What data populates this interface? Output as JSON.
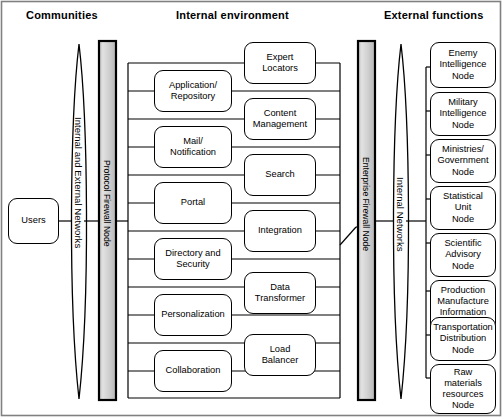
{
  "diagram": {
    "headers": [
      {
        "label": "Communities"
      },
      {
        "label": "Internal environment"
      },
      {
        "label": "External functions"
      }
    ],
    "users_node": {
      "label": "Users"
    },
    "networks_lens_left": {
      "label": "Internal and External Networks"
    },
    "networks_lens_right": {
      "label": "Internal Networks"
    },
    "firewalls": [
      {
        "label": "Protocol Firewall Node"
      },
      {
        "label": "Enterprise Firewall Node"
      }
    ],
    "internal_left_column": [
      {
        "label": "Application/\nRepository"
      },
      {
        "label": "Mail/\nNotification"
      },
      {
        "label": "Portal"
      },
      {
        "label": "Directory and\nSecurity"
      },
      {
        "label": "Personalization"
      },
      {
        "label": "Collaboration"
      }
    ],
    "internal_right_column": [
      {
        "label": "Expert\nLocators"
      },
      {
        "label": "Content\nManagement"
      },
      {
        "label": "Search"
      },
      {
        "label": "Integration"
      },
      {
        "label": "Data\nTransformer"
      },
      {
        "label": "Load\nBalancer"
      }
    ],
    "external_nodes": [
      {
        "label": "Enemy\nIntelligence\nNode"
      },
      {
        "label": "Military\nIntelligence\nNode"
      },
      {
        "label": "Ministries/\nGovernment\nNode"
      },
      {
        "label": "Statistical\nUnit\nNode"
      },
      {
        "label": "Scientific\nAdvisory\nNode"
      },
      {
        "label": "Production\nManufacture\nInformation\nNode"
      },
      {
        "label": "Transportation\nDistribution\nNode"
      },
      {
        "label": "Raw\nmaterials\nresources\nNode"
      }
    ],
    "colors": {
      "stroke": "#000000",
      "background": "#ffffff",
      "firewall_fill": "#d4d4d4",
      "border": "#6b6b6b"
    }
  }
}
